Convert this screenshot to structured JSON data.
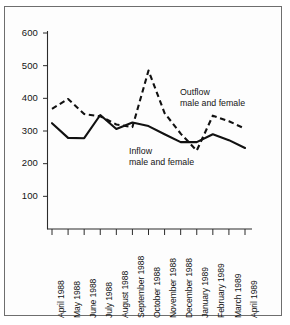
{
  "chart_data": {
    "type": "line",
    "title": "",
    "xlabel": "",
    "ylabel": "",
    "ylim": [
      0,
      600
    ],
    "yticks": [
      100,
      200,
      300,
      400,
      500,
      600
    ],
    "grid": false,
    "legend_position": "inline-annotation",
    "categories": [
      "April 1988",
      "May 1988",
      "June 1988",
      "July 1988",
      "August 1988",
      "September 1988",
      "October 1988",
      "November 1988",
      "December 1988",
      "January 1989",
      "February 1989",
      "March 1989",
      "April 1989"
    ],
    "series": [
      {
        "name": "Outflow male and female",
        "style": "dashed",
        "values": [
          368,
          398,
          352,
          345,
          320,
          312,
          485,
          355,
          292,
          240,
          347,
          330,
          307
        ]
      },
      {
        "name": "Inflow male and female",
        "style": "solid",
        "values": [
          324,
          279,
          278,
          349,
          306,
          326,
          315,
          290,
          266,
          266,
          290,
          272,
          248
        ]
      }
    ],
    "annotations": [
      {
        "id": "outflow",
        "line1": "Outflow",
        "line2": "male and female"
      },
      {
        "id": "inflow",
        "line1": "Inflow",
        "line2": "male and female"
      }
    ]
  },
  "axis": {
    "y_tick_labels": [
      "600",
      "500",
      "400",
      "300",
      "200",
      "100"
    ]
  },
  "colors": {
    "line": "#111111",
    "axis": "#333333",
    "frame": "#6e6e6e",
    "background": "#ffffff"
  }
}
